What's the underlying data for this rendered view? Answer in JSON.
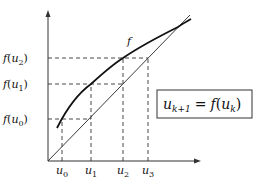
{
  "diagram": {
    "curve_label": "f",
    "y_labels": [
      {
        "fn": "f",
        "var": "u",
        "sub": "2"
      },
      {
        "fn": "f",
        "var": "u",
        "sub": "1"
      },
      {
        "fn": "f",
        "var": "u",
        "sub": "0"
      }
    ],
    "x_labels": [
      {
        "var": "u",
        "sub": "0"
      },
      {
        "var": "u",
        "sub": "1"
      },
      {
        "var": "u",
        "sub": "2"
      },
      {
        "var": "u",
        "sub": "3"
      }
    ],
    "formula": {
      "lhs_var": "u",
      "lhs_sub": "k+1",
      "eq": "=",
      "fn": "f",
      "open": "(",
      "rhs_var": "u",
      "rhs_sub": "k",
      "close": ")"
    },
    "colors": {
      "curve": "#111111",
      "diagonal": "#222222",
      "axis": "#333333",
      "dashed": "#333333"
    }
  }
}
